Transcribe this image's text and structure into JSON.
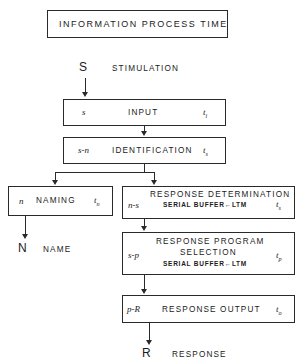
{
  "title_box": {
    "label": "INFORMATION  PROCESS     TIME"
  },
  "nodes": {
    "stimulation": {
      "symbol": "S",
      "label": "STIMULATION"
    },
    "name": {
      "symbol": "N",
      "label": "NAME"
    },
    "response": {
      "symbol": "R",
      "label": "RESPONSE"
    }
  },
  "stages": [
    {
      "id": "input",
      "code": "s",
      "label": "INPUT",
      "sublabel": "",
      "time": "t",
      "time_sub": "i"
    },
    {
      "id": "identification",
      "code": "s-n",
      "label": "IDENTIFICATION",
      "sublabel": "",
      "time": "t",
      "time_sub": "s"
    },
    {
      "id": "naming",
      "code": "n",
      "label": "NAMING",
      "sublabel": "",
      "time": "t",
      "time_sub": "n"
    },
    {
      "id": "response-determination",
      "code": "n-s",
      "label": "RESPONSE DETERMINATION",
      "sublabel": "SERIAL BUFFER←LTM",
      "time": "t",
      "time_sub": "s"
    },
    {
      "id": "response-program-selection",
      "code": "s-p",
      "label": "RESPONSE PROGRAM",
      "label2": "SELECTION",
      "sublabel": "SERIAL BUFFER←LTM",
      "time": "t",
      "time_sub": "p"
    },
    {
      "id": "response-output",
      "code": "p-R",
      "label": "RESPONSE OUTPUT",
      "sublabel": "",
      "time": "t",
      "time_sub": "o"
    }
  ],
  "colors": {
    "ink": "#2a2a2a",
    "background": "#ffffff"
  }
}
